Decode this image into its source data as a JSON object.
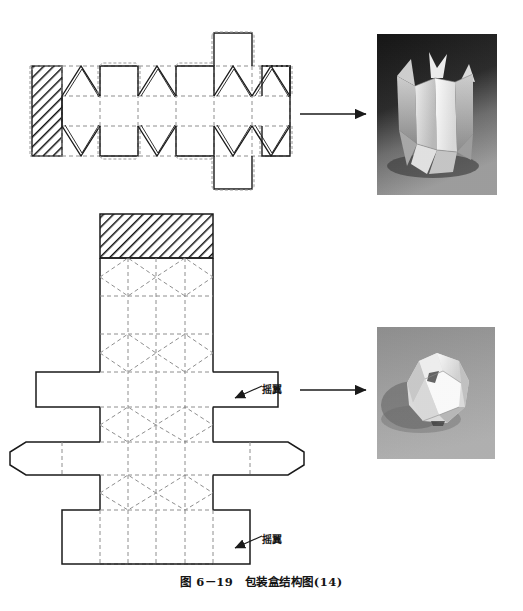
{
  "figure": {
    "caption": "图 6－19　包装盒结构图(14)",
    "labels": {
      "flap_upper": "摇翼",
      "flap_lower": "摇翼"
    }
  },
  "diagrams": [
    {
      "id": "dieline-top",
      "name": "horizontal-dieline",
      "description": "横向展开的包装盒结构展开图，含斜线阴影粘合舌、多个面板与三角摇翼",
      "glue_flap": {
        "hatched": true,
        "x": 32,
        "y": 66,
        "width": 30,
        "height": 90
      },
      "body": {
        "x": 62,
        "y": 66,
        "width": 228,
        "height": 90
      },
      "fold_rows": [
        66,
        96,
        126,
        156
      ],
      "panel_columns": [
        62,
        100,
        138,
        176,
        214,
        252,
        290
      ]
    },
    {
      "id": "dieline-bottom",
      "name": "vertical-dieline",
      "description": "纵向展开的包装盒结构展开图，含顶部斜线阴影粘合舌、菱形折线与上下摇翼",
      "glue_flap": {
        "hatched": true,
        "x": 100,
        "y": 214,
        "width": 113,
        "height": 44
      },
      "body": {
        "x": 100,
        "y": 258,
        "width": 113,
        "height": 306
      }
    }
  ],
  "photos": [
    {
      "id": "photo-top",
      "name": "finished-box-tall",
      "alt": "立式折纸包装盒成品照片（深色背景）",
      "x": 373,
      "y": 30,
      "width": 128,
      "height": 169,
      "background": "#2f2f2f"
    },
    {
      "id": "photo-bottom",
      "name": "finished-box-round",
      "alt": "球形折纸包装盒成品照片（灰色背景）",
      "x": 373,
      "y": 323,
      "width": 126,
      "height": 140,
      "background": "#9a9a9a"
    }
  ],
  "arrows": [
    {
      "id": "arrow-top",
      "name": "arrow-to-photo-top",
      "x1": 300,
      "y1": 114,
      "x2": 368,
      "y2": 114
    },
    {
      "id": "arrow-bottom",
      "name": "arrow-to-photo-bottom",
      "x1": 300,
      "y1": 390,
      "x2": 368,
      "y2": 390
    }
  ],
  "colors": {
    "cut_line": "#1a1a1a",
    "fold_line": "#8c8c8c",
    "hatch": "#111111",
    "paper": "#ffffff",
    "caption_text": "#141414"
  }
}
